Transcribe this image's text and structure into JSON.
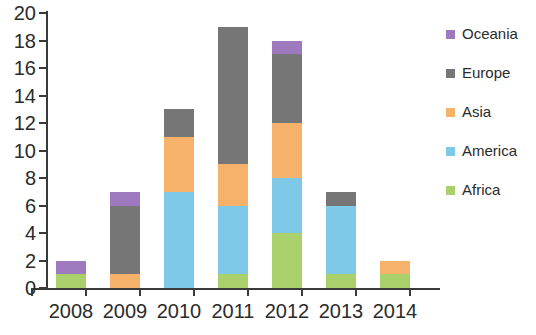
{
  "chart_data": {
    "type": "bar",
    "stacked": true,
    "title": "",
    "subtitle": "",
    "xlabel": "",
    "ylabel": "",
    "categories": [
      "2008",
      "2009",
      "2010",
      "2011",
      "2012",
      "2013",
      "2014"
    ],
    "ylim": [
      0,
      20
    ],
    "ytick_labels": [
      "0",
      "2",
      "4",
      "6",
      "8",
      "10",
      "12",
      "14",
      "16",
      "18",
      "20"
    ],
    "ytick_values": [
      0,
      2,
      4,
      6,
      8,
      10,
      12,
      14,
      16,
      18,
      20
    ],
    "grid": false,
    "legend_position": "right",
    "series": [
      {
        "name": "Africa",
        "color": "#a9d06a",
        "values": [
          1,
          0,
          0,
          1,
          4,
          1,
          1
        ]
      },
      {
        "name": "America",
        "color": "#7ec8e8",
        "values": [
          0,
          0,
          7,
          5,
          4,
          5,
          0
        ]
      },
      {
        "name": "Asia",
        "color": "#f9b койот",
        "values": [
          0,
          1,
          4,
          3,
          4,
          0,
          1
        ]
      },
      {
        "name": "Europe",
        "color": "#767676",
        "values": [
          0,
          5,
          2,
          10,
          5,
          1,
          0
        ]
      },
      {
        "name": "Oceania",
        "color": "#9f79bd",
        "values": [
          1,
          1,
          0,
          0,
          1,
          0,
          0
        ]
      }
    ],
    "stack_order_bottom_to_top": [
      "Africa",
      "America",
      "Asia",
      "Europe",
      "Oceania"
    ],
    "totals": [
      2,
      7,
      13,
      19,
      18,
      7,
      2
    ]
  },
  "legend": {
    "entries": [
      {
        "label": "Oceania",
        "color": "#9f79bd"
      },
      {
        "label": "Europe",
        "color": "#767676"
      },
      {
        "label": "Asia",
        "color": "#f6b26b"
      },
      {
        "label": "America",
        "color": "#7ec8e8"
      },
      {
        "label": "Africa",
        "color": "#a9d06a"
      }
    ]
  },
  "colors": {
    "oceania": "#9f79bd",
    "europe": "#767676",
    "asia": "#f6b26b",
    "america": "#7ec8e8",
    "africa": "#a9d06a",
    "axis": "#3a3a3a",
    "text": "#2b2b2b",
    "background": "#ffffff"
  }
}
